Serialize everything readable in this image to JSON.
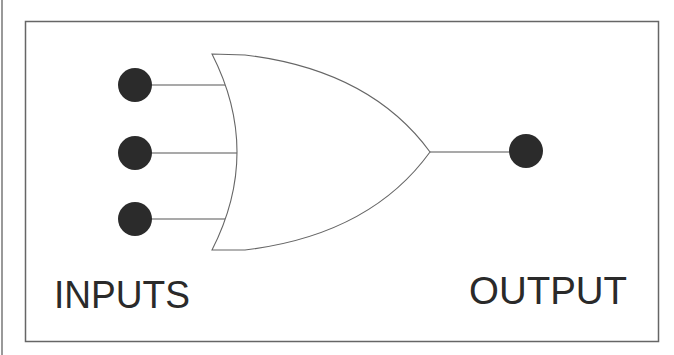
{
  "diagram": {
    "type": "or-gate",
    "labels": {
      "inputs": "INPUTS",
      "output": "OUTPUT"
    },
    "inputs": [
      {
        "name": "input-1",
        "cx": 135,
        "cy": 85,
        "wire_end_x": 226
      },
      {
        "name": "input-2",
        "cx": 135,
        "cy": 153,
        "wire_end_x": 238
      },
      {
        "name": "input-3",
        "cx": 135,
        "cy": 219,
        "wire_end_x": 226
      }
    ],
    "output": {
      "cx": 526,
      "cy": 151,
      "wire_start_x": 430
    },
    "colors": {
      "terminal": "#2b2b2b",
      "line": "#555555",
      "text": "#2a2a2a",
      "frame": "#666666"
    }
  }
}
